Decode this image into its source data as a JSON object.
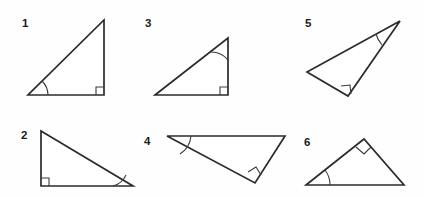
{
  "figure": {
    "background_color": "#fefefe",
    "stroke_color": "#2b2b2b",
    "mark_color": "#3a3a3a",
    "width": 424,
    "height": 197
  },
  "triangles": [
    {
      "label": "1",
      "label_x": 22,
      "label_y": 27,
      "points": "28,95 104,95 104,20",
      "right_angle": {
        "path": "M 96,95 L 96,87 L 104,87",
        "vertex": "bottom-right"
      },
      "marked_angle": {
        "path": "M 48,95 A 20,20 0 0 0 42,81",
        "vertex": "bottom-left"
      }
    },
    {
      "label": "2",
      "label_x": 21,
      "label_y": 139,
      "points": "41,131 41,186 133,186",
      "right_angle": {
        "path": "M 49,186 L 49,178 L 41,178",
        "vertex": "bottom-left"
      },
      "marked_angle": {
        "path": "M 113,186 A 20,20 0 0 0 126,175",
        "vertex": "bottom-right"
      }
    },
    {
      "label": "3",
      "label_x": 145,
      "label_y": 27,
      "points": "155,95 228,95 228,38",
      "right_angle": {
        "path": "M 220,95 L 220,87 L 228,87",
        "vertex": "bottom-right"
      },
      "marked_angle": {
        "path": "M 228,60 A 22,22 0 0 0 210,52",
        "vertex": "top"
      }
    },
    {
      "label": "4",
      "label_x": 144,
      "label_y": 145,
      "points": "167,136 285,136 255,183",
      "right_angle": {
        "path": "M 248,172 L 256,167 L 261,175",
        "vertex": "bottom"
      },
      "marked_angle": {
        "path": "M 191,136 A 24,24 0 0 1 180,154",
        "vertex": "top-left"
      }
    },
    {
      "label": "5",
      "label_x": 305,
      "label_y": 27,
      "points": "400,21 307,72 348,96",
      "right_angle": {
        "path": "M 341,86 L 350,85 L 351,94",
        "vertex": "bottom"
      },
      "marked_angle": {
        "path": "M 376,34 A 27,27 0 0 0 382,45",
        "vertex": "top-right"
      }
    },
    {
      "label": "6",
      "label_x": 304,
      "label_y": 146,
      "points": "306,185 364,139 404,185",
      "right_angle": {
        "path": "M 356,147 L 364,154 L 371,147",
        "vertex": "apex"
      },
      "marked_angle": {
        "path": "M 330,185 A 24,24 0 0 0 325,170",
        "vertex": "bottom-left"
      }
    }
  ]
}
